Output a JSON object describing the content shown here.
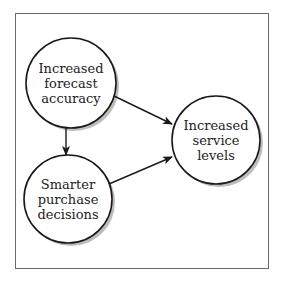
{
  "diagram": {
    "nodes": [
      {
        "id": "forecast",
        "lines": [
          "Increased",
          "forecast",
          "accuracy"
        ],
        "cx": 71,
        "cy": 83,
        "r": 45
      },
      {
        "id": "purchase",
        "lines": [
          "Smarter",
          "purchase",
          "decisions"
        ],
        "cx": 68,
        "cy": 199,
        "r": 44
      },
      {
        "id": "service",
        "lines": [
          "Increased",
          "service",
          "levels"
        ],
        "cx": 216,
        "cy": 140,
        "r": 44
      }
    ],
    "edges": [
      {
        "from": "forecast",
        "to": "purchase"
      },
      {
        "from": "forecast",
        "to": "service"
      },
      {
        "from": "purchase",
        "to": "service"
      }
    ],
    "colors": {
      "stroke": "#1a1a1a",
      "shadow": "#b8b8b8",
      "frame": "#6a6a6a"
    }
  }
}
